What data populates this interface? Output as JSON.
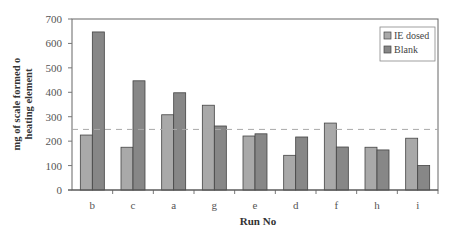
{
  "chart_data": {
    "type": "bar",
    "title": "",
    "xlabel": "Run No",
    "ylabel": "mg of scale formed o heating element",
    "ylabel_lines": [
      "mg of scale formed o",
      "heating element"
    ],
    "categories": [
      "b",
      "c",
      "a",
      "g",
      "e",
      "d",
      "f",
      "h",
      "i"
    ],
    "series": [
      {
        "name": "IE dosed",
        "color": "#a9a9a9",
        "values": [
          225,
          175,
          308,
          347,
          221,
          142,
          274,
          175,
          212
        ]
      },
      {
        "name": "Blank",
        "color": "#878787",
        "values": [
          647,
          447,
          398,
          262,
          230,
          217,
          176,
          164,
          100
        ]
      }
    ],
    "ylim": [
      0,
      700
    ],
    "yticks": [
      0,
      100,
      200,
      300,
      400,
      500,
      600,
      700
    ],
    "reference_line": {
      "value": 248,
      "style": "dashed"
    },
    "grid": false,
    "legend": {
      "position": "upper right",
      "entries": [
        "IE dosed",
        "Blank"
      ]
    }
  }
}
